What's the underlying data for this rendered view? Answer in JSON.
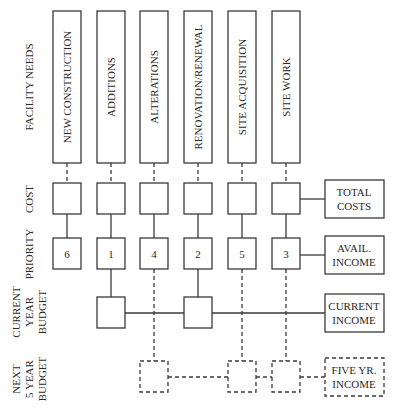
{
  "row_labels": {
    "facility_needs": "FACILITY NEEDS",
    "cost": "COST",
    "priority": "PRIORITY",
    "current_year_budget": [
      "CURRENT",
      "YEAR",
      "BUDGET"
    ],
    "next_5_year_budget": [
      "NEXT",
      "5 YEAR",
      "BUDGET"
    ]
  },
  "facility_needs": [
    {
      "label": "NEW CONSTRUCTION",
      "priority": "6",
      "current_year": false,
      "five_year": false
    },
    {
      "label": "ADDITIONS",
      "priority": "1",
      "current_year": true,
      "five_year": false
    },
    {
      "label": "ALTERATIONS",
      "priority": "4",
      "current_year": false,
      "five_year": true
    },
    {
      "label": "RENOVATION/RENEWAL",
      "priority": "2",
      "current_year": true,
      "five_year": false
    },
    {
      "label": "SITE ACQUISITION",
      "priority": "5",
      "current_year": false,
      "five_year": true
    },
    {
      "label": "SITE WORK",
      "priority": "3",
      "current_year": false,
      "five_year": true
    }
  ],
  "summary_boxes": {
    "total_costs": [
      "TOTAL",
      "COSTS"
    ],
    "avail_income": [
      "AVAIL.",
      "INCOME"
    ],
    "current_income": [
      "CURRENT",
      "INCOME"
    ],
    "five_yr_income": [
      "FIVE YR.",
      "INCOME"
    ]
  },
  "colors": {
    "stroke": "#3a3a3a",
    "text": "#2a2a2a",
    "background": "#ffffff"
  }
}
